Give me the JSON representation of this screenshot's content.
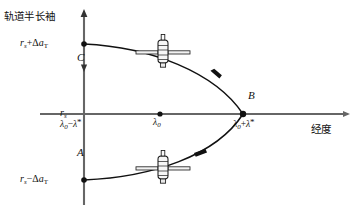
{
  "figure": {
    "kind": "orbit-longitude-drift-diagram",
    "background": "#ffffff",
    "line_color": "#111111",
    "axis_color": "#555555",
    "width": 353,
    "height": 214
  },
  "axes": {
    "y_axis_label": "轨道半长袖",
    "x_axis_label": "经度",
    "y_ticks": [
      {
        "id": "upper",
        "text_html": "r_s+Δa_T",
        "value_label": "rₛ+Δaₜ",
        "y_px": 44
      },
      {
        "id": "center",
        "text_html": "r_s",
        "value_label": "rₛ",
        "y_px": 114
      },
      {
        "id": "lower",
        "text_html": "r_s-Δa_T",
        "value_label": "rₛ−Δaₜ",
        "y_px": 180
      }
    ],
    "x_ticks": [
      {
        "id": "left",
        "label": "λ₀−λ*",
        "x_px": 84
      },
      {
        "id": "center",
        "label": "λ₀",
        "x_px": 160
      },
      {
        "id": "right",
        "label": "λ₀+λ*",
        "x_px": 243
      }
    ]
  },
  "point_labels": [
    {
      "name": "C",
      "text": "C",
      "x_px": 80,
      "y_px": 58
    },
    {
      "name": "B",
      "text": "B",
      "x_px": 250,
      "y_px": 95
    },
    {
      "name": "A",
      "text": "A",
      "x_px": 80,
      "y_px": 152
    }
  ],
  "markers": [
    {
      "name": "upper-endpoint",
      "x_px": 84,
      "y_px": 44
    },
    {
      "name": "center-origin",
      "x_px": 160,
      "y_px": 114
    },
    {
      "name": "vertex-B",
      "x_px": 243,
      "y_px": 114
    },
    {
      "name": "lower-endpoint",
      "x_px": 84,
      "y_px": 180
    }
  ],
  "satellites": [
    {
      "name": "satellite-upper",
      "x_px": 163,
      "y_px": 52
    },
    {
      "name": "satellite-lower",
      "x_px": 163,
      "y_px": 168
    }
  ],
  "arrows": [
    {
      "name": "arrow-upper-branch",
      "x_px": 213,
      "y_px": 70,
      "direction": "down-right"
    },
    {
      "name": "arrow-lower-branch",
      "x_px": 200,
      "y_px": 155,
      "direction": "down-left"
    },
    {
      "name": "arrow-y-axis-tip",
      "x_px": 84,
      "y_px": 14,
      "direction": "up"
    },
    {
      "name": "arrow-y-axis-mid",
      "x_px": 84,
      "y_px": 68,
      "direction": "down"
    },
    {
      "name": "arrow-x-axis-tip",
      "x_px": 345,
      "y_px": 114,
      "direction": "right"
    }
  ]
}
